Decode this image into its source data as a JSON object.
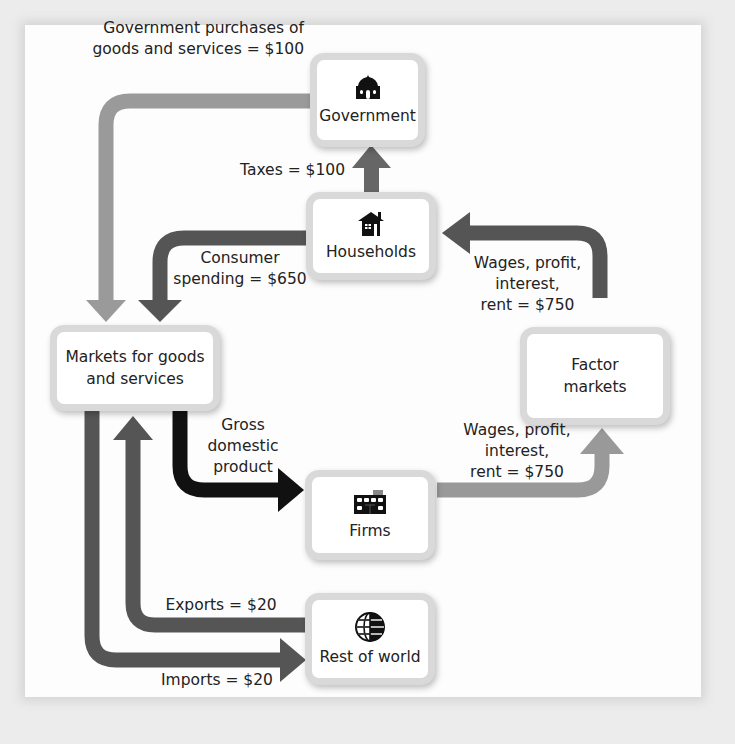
{
  "nodes": {
    "government": {
      "label": "Government",
      "icon": "government-building-icon"
    },
    "households": {
      "label": "Households",
      "icon": "house-icon"
    },
    "markets_goods": {
      "label_line1": "Markets for goods",
      "label_line2": "and services"
    },
    "factor_markets": {
      "label_line1": "Factor",
      "label_line2": "markets"
    },
    "firms": {
      "label": "Firms",
      "icon": "factory-building-icon"
    },
    "rest_of_world": {
      "label": "Rest of world",
      "icon": "globe-icon"
    }
  },
  "flows": {
    "gov_purchases": {
      "line1": "Government purchases of",
      "line2": "goods and services = $100",
      "value": 100
    },
    "taxes": {
      "text": "Taxes = $100",
      "value": 100
    },
    "consumer_spending": {
      "line1": "Consumer",
      "line2": "spending = $650",
      "value": 650
    },
    "factor_income_to_households": {
      "line1": "Wages, profit,",
      "line2": "interest,",
      "line3": "rent = $750",
      "value": 750
    },
    "gdp": {
      "line1": "Gross",
      "line2": "domestic",
      "line3": "product"
    },
    "firms_to_factor": {
      "line1": "Wages, profit,",
      "line2": "interest,",
      "line3": "rent = $750",
      "value": 750
    },
    "exports": {
      "text": "Exports = $20",
      "value": 20
    },
    "imports": {
      "text": "Imports = $20",
      "value": 20
    }
  },
  "colors": {
    "light_arrow": "#999999",
    "mid_arrow": "#555555",
    "dark_arrow": "#111111",
    "box_border": "#d9d9d9"
  }
}
